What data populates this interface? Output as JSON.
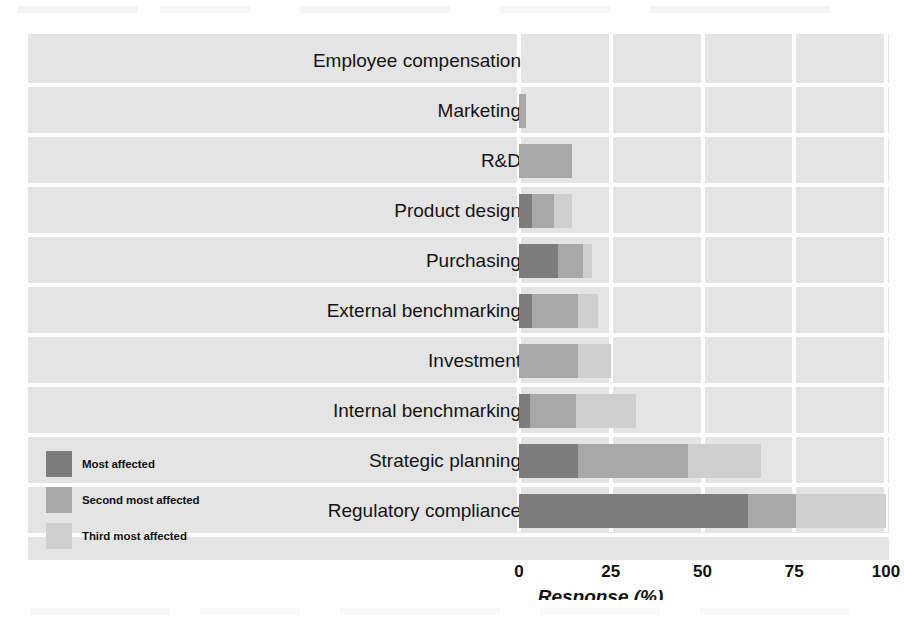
{
  "chart_data": {
    "type": "bar",
    "orientation": "horizontal",
    "stacked": true,
    "title": "",
    "xlabel": "Response (%)",
    "ylabel": "",
    "xlim": [
      0,
      100
    ],
    "xticks": [
      0,
      25,
      50,
      75,
      100
    ],
    "xtick_labels": [
      "0",
      "25",
      "50",
      "75",
      "100"
    ],
    "grid": "vertical white gridlines on grey panel",
    "legend_position": "lower-left inside panel",
    "categories": [
      "Employee compensation",
      "Marketing",
      "R&D",
      "Product design",
      "Purchasing",
      "External benchmarking",
      "Investment",
      "Internal benchmarking",
      "Strategic planning",
      "Regulatory compliance"
    ],
    "series": [
      {
        "name": "Most affected",
        "color": "#7c7c7c",
        "values": [
          0,
          0,
          0,
          3.5,
          10.5,
          3.5,
          0,
          3.0,
          16.0,
          62.5
        ]
      },
      {
        "name": "Second most affected",
        "color": "#a8a8a8",
        "values": [
          0,
          2.0,
          14.5,
          6.0,
          7.0,
          12.5,
          16.0,
          12.5,
          30.0,
          13.0
        ]
      },
      {
        "name": "Third most affected",
        "color": "#cfcfcf",
        "values": [
          0,
          0,
          0,
          5.0,
          2.5,
          5.5,
          9.0,
          16.5,
          20.0,
          24.5
        ]
      }
    ],
    "totals": [
      0,
      2.0,
      14.5,
      14.5,
      20.0,
      21.5,
      25.0,
      32.0,
      66.0,
      100.0
    ]
  },
  "legend": {
    "items": [
      {
        "label": "Most affected",
        "color": "#7c7c7c"
      },
      {
        "label": "Second most affected",
        "color": "#a8a8a8"
      },
      {
        "label": "Third most affected",
        "color": "#cfcfcf"
      }
    ]
  },
  "axis": {
    "title": "Response (%)",
    "ticks": [
      "0",
      "25",
      "50",
      "75",
      "100"
    ]
  },
  "colors": {
    "panel_background": "#e4e4e4",
    "gridline": "#ffffff",
    "text": "#141414",
    "most_affected": "#7c7c7c",
    "second_most_affected": "#a8a8a8",
    "third_most_affected": "#cfcfcf"
  }
}
